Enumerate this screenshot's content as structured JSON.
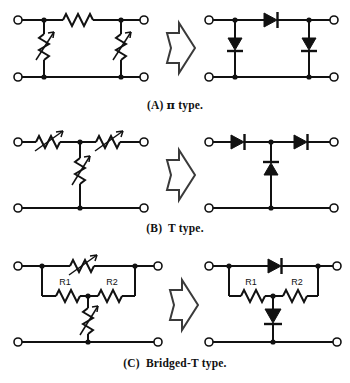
{
  "figure": {
    "background_color": "#ffffff",
    "ink_color": "#111111",
    "rows": [
      {
        "id": "row-a",
        "caption_label": "(A)",
        "caption_symbol": "π",
        "caption_text": "type.",
        "caption_full": "(A) π type.",
        "left_circuit": {
          "name": "pi-attenuator-resistive",
          "topology": "pi",
          "components": [
            {
              "ref": "series-resistor",
              "symbol": "resistor",
              "orientation": "horizontal",
              "label": ""
            },
            {
              "ref": "shunt-left",
              "symbol": "variable-resistor",
              "orientation": "vertical",
              "label": ""
            },
            {
              "ref": "shunt-right",
              "symbol": "variable-resistor",
              "orientation": "vertical",
              "label": ""
            }
          ],
          "terminals": 4
        },
        "right_circuit": {
          "name": "pi-attenuator-diode",
          "topology": "pi",
          "components": [
            {
              "ref": "series-diode",
              "symbol": "diode",
              "orientation": "horizontal",
              "direction": "right",
              "label": ""
            },
            {
              "ref": "shunt-diode-left",
              "symbol": "diode",
              "orientation": "vertical",
              "direction": "down",
              "label": ""
            },
            {
              "ref": "shunt-diode-right",
              "symbol": "diode",
              "orientation": "vertical",
              "direction": "down",
              "label": ""
            }
          ],
          "terminals": 4
        }
      },
      {
        "id": "row-b",
        "caption_label": "(B)",
        "caption_symbol": "T",
        "caption_text": "type.",
        "caption_full": "(B) T type.",
        "left_circuit": {
          "name": "t-attenuator-resistive",
          "topology": "t",
          "components": [
            {
              "ref": "series-left",
              "symbol": "variable-resistor",
              "orientation": "horizontal",
              "label": ""
            },
            {
              "ref": "series-right",
              "symbol": "variable-resistor",
              "orientation": "horizontal",
              "label": ""
            },
            {
              "ref": "shunt-middle",
              "symbol": "variable-resistor",
              "orientation": "vertical",
              "label": ""
            }
          ],
          "terminals": 4
        },
        "right_circuit": {
          "name": "t-attenuator-diode",
          "topology": "t",
          "components": [
            {
              "ref": "series-diode-left",
              "symbol": "diode",
              "orientation": "horizontal",
              "direction": "right",
              "label": ""
            },
            {
              "ref": "series-diode-right",
              "symbol": "diode",
              "orientation": "horizontal",
              "direction": "right",
              "label": ""
            },
            {
              "ref": "shunt-diode-middle",
              "symbol": "diode",
              "orientation": "vertical",
              "direction": "up",
              "label": ""
            }
          ],
          "terminals": 4
        }
      },
      {
        "id": "row-c",
        "caption_label": "(C)",
        "caption_symbol": "Bridged-T",
        "caption_text": "type.",
        "caption_full": "(C) Bridged-T type.",
        "left_circuit": {
          "name": "bridged-t-attenuator-resistive",
          "topology": "bridged-t",
          "components": [
            {
              "ref": "bridge",
              "symbol": "variable-resistor",
              "orientation": "horizontal",
              "label": ""
            },
            {
              "ref": "r1",
              "symbol": "resistor",
              "orientation": "horizontal",
              "label": "R1"
            },
            {
              "ref": "r2",
              "symbol": "resistor",
              "orientation": "horizontal",
              "label": "R2"
            },
            {
              "ref": "shunt",
              "symbol": "variable-resistor",
              "orientation": "vertical",
              "label": ""
            }
          ],
          "terminals": 4
        },
        "right_circuit": {
          "name": "bridged-t-attenuator-diode",
          "topology": "bridged-t",
          "components": [
            {
              "ref": "bridge-diode",
              "symbol": "diode",
              "orientation": "horizontal",
              "direction": "right",
              "label": ""
            },
            {
              "ref": "r1",
              "symbol": "resistor",
              "orientation": "horizontal",
              "label": "R1"
            },
            {
              "ref": "r2",
              "symbol": "resistor",
              "orientation": "horizontal",
              "label": "R2"
            },
            {
              "ref": "shunt-diode",
              "symbol": "diode",
              "orientation": "vertical",
              "direction": "down",
              "label": ""
            }
          ],
          "terminals": 4
        }
      }
    ],
    "transform_arrow": {
      "name": "rightward-hollow-arrow",
      "direction": "right",
      "style": "outline"
    },
    "labels": {
      "r1": "R1",
      "r2": "R2"
    }
  }
}
